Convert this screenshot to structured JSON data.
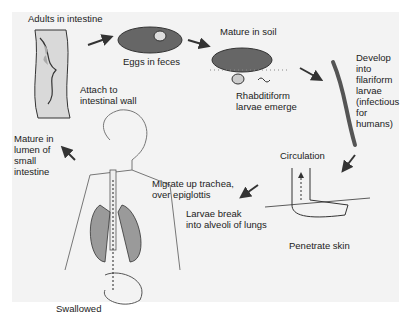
{
  "diagram": {
    "type": "life-cycle",
    "colors": {
      "background": "#f3f3f3",
      "organ_fill": "#9a9a9a",
      "outline": "#333333",
      "arrow": "#333333"
    },
    "stages": [
      {
        "id": "adults",
        "label": "Adults in intestine"
      },
      {
        "id": "eggs",
        "label": "Eggs in feces"
      },
      {
        "id": "soil",
        "label": "Mature in soil"
      },
      {
        "id": "rhabditiform",
        "label": "Rhabditiform\nlarvae emerge"
      },
      {
        "id": "filariform",
        "label": "Develop\ninto\nfilariform\nlarvae\n(infectious\nfor\nhumans)"
      },
      {
        "id": "circulation",
        "label": "Circulation"
      },
      {
        "id": "penetrate",
        "label": "Penetrate skin"
      },
      {
        "id": "alveoli",
        "label": "Larvae break\ninto alveoli of lungs"
      },
      {
        "id": "trachea",
        "label": "Migrate up trachea,\nover epiglottis"
      },
      {
        "id": "swallowed",
        "label": "Swallowed"
      },
      {
        "id": "lumen",
        "label": "Mature in\nlumen of\nsmall\nintestine"
      },
      {
        "id": "attach",
        "label": "Attach to\nintestinal wall"
      }
    ]
  }
}
